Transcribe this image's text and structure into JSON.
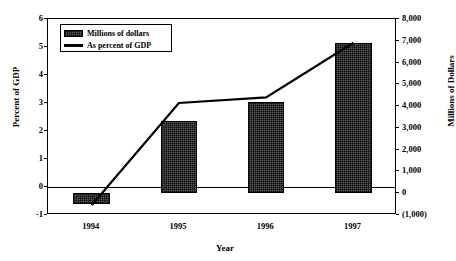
{
  "chart_data": {
    "type": "bar",
    "title": "",
    "categories": [
      "1994",
      "1995",
      "1996",
      "1997"
    ],
    "xlabel": "Year",
    "series": [
      {
        "name": "Millions of dollars",
        "type": "bar",
        "axis": "right",
        "unit": "Millions of Dollars",
        "values": [
          -500,
          3300,
          4200,
          6900
        ]
      },
      {
        "name": "As percent of GDP",
        "type": "line",
        "axis": "left",
        "unit": "Percent of GDP",
        "values": [
          -0.65,
          3.0,
          3.2,
          5.15
        ]
      }
    ],
    "left_axis": {
      "label": "Percent of GDP",
      "ylim": [
        -1,
        6
      ],
      "ticks": [
        "6",
        "5",
        "4",
        "3",
        "2",
        "1",
        "0",
        "-1"
      ],
      "tick_values": [
        6,
        5,
        4,
        3,
        2,
        1,
        0,
        -1
      ]
    },
    "right_axis": {
      "label": "Millions of Dollars",
      "ylim": [
        -1000,
        8000
      ],
      "ticks": [
        "8,000",
        "7,000",
        "6,000",
        "5,000",
        "4,000",
        "3,000",
        "2,000",
        "1,000",
        "0",
        "(1,000)"
      ],
      "tick_values": [
        8000,
        7000,
        6000,
        5000,
        4000,
        3000,
        2000,
        1000,
        0,
        -1000
      ]
    },
    "grid": false,
    "legend_position": "top-left",
    "legend": [
      "Millions of dollars",
      "As percent of GDP"
    ]
  },
  "legend": {
    "bar_label": "Millions of dollars",
    "line_label": "As percent of GDP"
  },
  "axes": {
    "left_title": "Percent of GDP",
    "right_title": "Millions of Dollars",
    "x_title": "Year"
  },
  "ticks": {
    "left": [
      "6",
      "5",
      "4",
      "3",
      "2",
      "1",
      "0",
      "-1"
    ],
    "right": [
      "8,000",
      "7,000",
      "6,000",
      "5,000",
      "4,000",
      "3,000",
      "2,000",
      "1,000",
      "0",
      "(1,000)"
    ],
    "x": [
      "1994",
      "1995",
      "1996",
      "1997"
    ]
  },
  "colors": {
    "bar_fill": "#5a5a5a",
    "line": "#000000",
    "axis": "#000000",
    "background": "#ffffff"
  }
}
